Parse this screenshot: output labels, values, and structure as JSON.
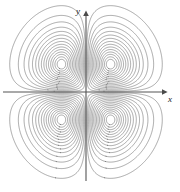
{
  "figure": {
    "title": "",
    "background_color": "#ffffff"
  },
  "axes": {
    "x_label": "x",
    "y_label": "y",
    "axis_color": "#555555",
    "origin_px": {
      "x": 86,
      "y": 92
    },
    "x_axis_px": {
      "x_start": 3,
      "x_end": 168,
      "y": 92
    },
    "y_axis_px": {
      "y_start": 10,
      "y_end": 181,
      "x": 86
    }
  },
  "chart_data": {
    "type": "contour",
    "title": "",
    "xlabel": "x",
    "ylabel": "y",
    "grid": false,
    "legend": null,
    "function": "f(x,y) = x*y*exp(-x^2 - y^2)",
    "xlim": [
      -2.6,
      2.6
    ],
    "ylim": [
      -2.45,
      2.45
    ],
    "contour_count": 15,
    "contour_color": "#6e6e6e",
    "contour_line_width": 0.6,
    "level_fractions": [
      0.04,
      0.1,
      0.17,
      0.25,
      0.33,
      0.41,
      0.49,
      0.57,
      0.645,
      0.715,
      0.78,
      0.84,
      0.89,
      0.935,
      0.97
    ],
    "extrema": [
      {
        "kind": "maximum",
        "x": -0.7071,
        "y": 0.7071,
        "value": 0.1839,
        "px": {
          "x": 53,
          "y": 63
        }
      },
      {
        "kind": "maximum",
        "x": 0.7071,
        "y": -0.7071,
        "value": 0.1839,
        "px": {
          "x": 122,
          "y": 130
        }
      },
      {
        "kind": "minimum",
        "x": 0.7071,
        "y": 0.7071,
        "value": -0.1839,
        "px": {
          "x": 122,
          "y": 63
        }
      },
      {
        "kind": "minimum",
        "x": -0.7071,
        "y": -0.7071,
        "value": -0.1839,
        "px": {
          "x": 53,
          "y": 130
        }
      }
    ],
    "saddle": {
      "x": 0,
      "y": 0,
      "value": 0,
      "px": {
        "x": 86,
        "y": 92
      }
    },
    "lobes": 4
  }
}
